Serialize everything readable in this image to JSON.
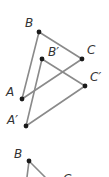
{
  "figure_top": {
    "triangle_original": {
      "points": {
        "A": {
          "label": "A",
          "x": 22,
          "y": 99
        },
        "B": {
          "label": "B",
          "x": 39,
          "y": 32
        },
        "C": {
          "label": "C",
          "x": 82,
          "y": 59
        }
      }
    },
    "triangle_image": {
      "points": {
        "A_prime": {
          "label": "A′",
          "x": 26,
          "y": 126
        },
        "B_prime": {
          "label": "B′",
          "x": 42,
          "y": 59
        },
        "C_prime": {
          "label": "C′",
          "x": 85,
          "y": 86
        }
      }
    }
  },
  "figure_bottom": {
    "points": {
      "B": {
        "label": "B",
        "x": 29,
        "y": 161
      },
      "C": {
        "label": "C"
      }
    }
  },
  "colors": {
    "segment": "#8a8a8a",
    "point": "#1a1a1a",
    "label": "#333333"
  }
}
